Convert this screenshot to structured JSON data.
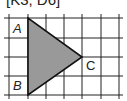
{
  "caption": "[K3, D6]",
  "diagram": {
    "type": "grid-triangle",
    "grid": {
      "vertical_lines_x": [
        9,
        28,
        46,
        64,
        82,
        101,
        119
      ],
      "horizontal_lines_y": [
        18,
        38,
        57,
        76,
        95
      ],
      "line_color": "#222222"
    },
    "triangle": {
      "fill": "#999999",
      "stroke": "#111111",
      "vertices": [
        {
          "label": "A",
          "x": 28,
          "y": 18
        },
        {
          "label": "B",
          "x": 28,
          "y": 95
        },
        {
          "label": "C",
          "x": 82,
          "y": 57
        }
      ]
    },
    "labels": {
      "A": "A",
      "B": "B",
      "C": "C"
    }
  }
}
